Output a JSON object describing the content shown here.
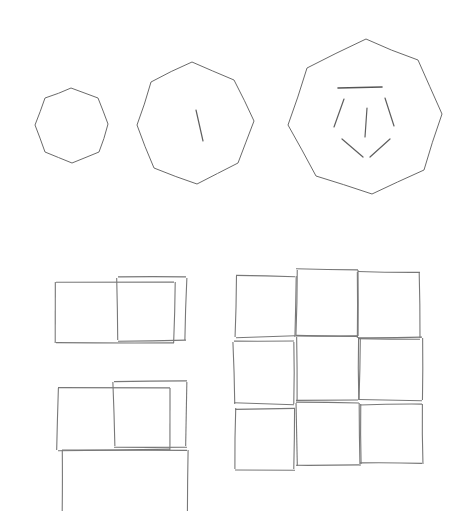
{
  "page": {
    "width": 461,
    "height": 511,
    "background_color": "#ffffff",
    "stroke_color": "#6e6e6e",
    "tick_color": "#5f5f5f"
  },
  "groups": [
    {
      "id": "polygon-row",
      "label": "Row of three octagons with interior tick marks",
      "shapes": [
        {
          "id": "octagon-small",
          "label": "Small octagon",
          "sides": 8,
          "center": [
            71,
            125
          ],
          "radius": 38,
          "tick_count": 0,
          "points": "71,88 98,98 108,124 99,152 72,163 45,152 35,125 45,98"
        },
        {
          "id": "octagon-medium",
          "label": "Medium octagon with one tick",
          "sides": 8,
          "center": [
            196,
            122
          ],
          "radius": 61,
          "tick_count": 1,
          "points": "192,62 234,80 254,121 238,163 197,184 154,168 137,125 151,82"
        },
        {
          "id": "octagon-large",
          "label": "Large octagon with six ticks",
          "sides": 8,
          "center": [
            365,
            118
          ],
          "radius": 81,
          "tick_count": 6,
          "points": "366,39 418,60 442,114 424,170 372,194 316,176 288,125 307,68"
        }
      ]
    },
    {
      "id": "rect-pair-upper",
      "label": "Upper pair of overlapping rectangles",
      "rectangles": [
        {
          "id": "rect-upper-left",
          "x": 56,
          "y": 282,
          "width": 118,
          "height": 61
        },
        {
          "id": "rect-upper-right",
          "x": 118,
          "y": 278,
          "width": 68,
          "height": 62
        }
      ]
    },
    {
      "id": "rect-stack-lower",
      "label": "Lower stack of three overlapping rectangles, bottom one cropped",
      "rectangles": [
        {
          "id": "rect-lower-left",
          "x": 58,
          "y": 388,
          "width": 112,
          "height": 62
        },
        {
          "id": "rect-lower-right",
          "x": 114,
          "y": 382,
          "width": 73,
          "height": 64
        },
        {
          "id": "rect-lower-bottom",
          "x": 62,
          "y": 450,
          "width": 125,
          "height": 61,
          "cropped": true
        }
      ]
    },
    {
      "id": "square-grid",
      "label": "Three by three grid of hand-drawn squares",
      "rows": 3,
      "cols": 3,
      "squares": [
        {
          "id": "cell-r1c1",
          "x": 236,
          "y": 276,
          "width": 59,
          "height": 61
        },
        {
          "id": "cell-r1c2",
          "x": 296,
          "y": 270,
          "width": 62,
          "height": 66
        },
        {
          "id": "cell-r1c3",
          "x": 358,
          "y": 272,
          "width": 62,
          "height": 66
        },
        {
          "id": "cell-r2c1",
          "x": 234,
          "y": 342,
          "width": 60,
          "height": 62
        },
        {
          "id": "cell-r2c2",
          "x": 296,
          "y": 337,
          "width": 62,
          "height": 63
        },
        {
          "id": "cell-r2c3",
          "x": 359,
          "y": 338,
          "width": 63,
          "height": 62
        },
        {
          "id": "cell-r3c1",
          "x": 235,
          "y": 408,
          "width": 60,
          "height": 61
        },
        {
          "id": "cell-r3c2",
          "x": 296,
          "y": 403,
          "width": 63,
          "height": 63
        },
        {
          "id": "cell-r3c3",
          "x": 360,
          "y": 404,
          "width": 62,
          "height": 60
        }
      ]
    }
  ],
  "ticks": {
    "octagon-medium": [
      {
        "id": "tick-m1",
        "x1": 196,
        "y1": 110,
        "x2": 203,
        "y2": 141
      }
    ],
    "octagon-large": [
      {
        "id": "tick-l-top",
        "x1": 338,
        "y1": 88,
        "x2": 382,
        "y2": 87
      },
      {
        "id": "tick-l-upper-left",
        "x1": 344,
        "y1": 99,
        "x2": 334,
        "y2": 127
      },
      {
        "id": "tick-l-upper-right",
        "x1": 385,
        "y1": 98,
        "x2": 394,
        "y2": 126
      },
      {
        "id": "tick-l-center",
        "x1": 367,
        "y1": 108,
        "x2": 365,
        "y2": 137
      },
      {
        "id": "tick-l-lower-left",
        "x1": 342,
        "y1": 139,
        "x2": 363,
        "y2": 157
      },
      {
        "id": "tick-l-lower-right",
        "x1": 390,
        "y1": 139,
        "x2": 370,
        "y2": 157
      }
    ]
  }
}
